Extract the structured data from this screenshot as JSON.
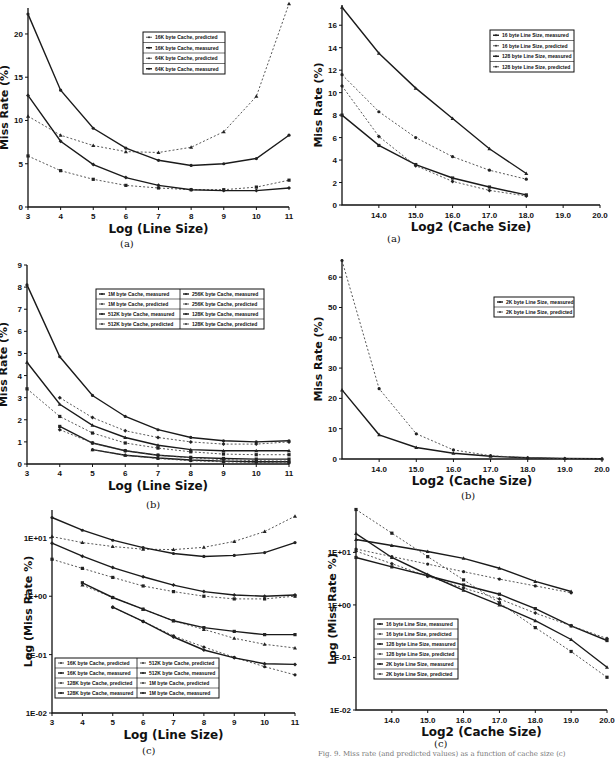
{
  "figure": {
    "footnote_fragment": "Fig. 9.  Miss rate (and predicted values) as a function of cache size (c)",
    "panels": {
      "left_a": {
        "label": "(a)"
      },
      "right_a": {
        "label": "(a)"
      },
      "left_b": {
        "label": "(b)"
      },
      "right_b": {
        "label": "(b)"
      },
      "left_c": {
        "label": "(c)"
      },
      "right_c": {
        "label": "(c)"
      }
    }
  },
  "chart_data": [
    {
      "id": "left_a",
      "type": "line",
      "title": "",
      "xlabel": "Log  (Line Size)",
      "ylabel": "Miss Rate (%)",
      "x": [
        3,
        4,
        5,
        6,
        7,
        8,
        9,
        10,
        11
      ],
      "xticks": [
        "3",
        "4",
        "5",
        "6",
        "7",
        "8",
        "9",
        "10",
        "11"
      ],
      "yticks": [
        "0",
        "5",
        "10",
        "15",
        "20"
      ],
      "ylim": [
        0,
        23
      ],
      "grid": false,
      "legend_position": "upper center",
      "series": [
        {
          "name": "16K byte Cache, predicted",
          "style": "dashed",
          "values": [
            10.5,
            8.3,
            7.1,
            6.4,
            6.3,
            6.9,
            8.7,
            12.8,
            23.5
          ]
        },
        {
          "name": "16K byte Cache, measured",
          "style": "solid",
          "values": [
            22.3,
            13.5,
            9.1,
            6.8,
            5.4,
            4.8,
            5.0,
            5.6,
            8.3
          ]
        },
        {
          "name": "64K byte Cache, predicted",
          "style": "dashed",
          "values": [
            5.9,
            4.2,
            3.2,
            2.5,
            2.2,
            2.0,
            2.0,
            2.3,
            3.1
          ]
        },
        {
          "name": "64K byte Cache, measured",
          "style": "solid",
          "values": [
            12.9,
            7.6,
            4.9,
            3.4,
            2.5,
            2.0,
            1.9,
            1.9,
            2.2
          ]
        }
      ]
    },
    {
      "id": "right_a",
      "type": "line",
      "title": "",
      "xlabel": "Log2 (Cache Size)",
      "ylabel": "Miss Rate (%)",
      "x": [
        13,
        14,
        15,
        16,
        17,
        18
      ],
      "xticks": [
        "14.0",
        "15.0",
        "16.0",
        "17.0",
        "18.0",
        "19.0",
        "20.0"
      ],
      "yticks": [
        "0",
        "2",
        "4",
        "6",
        "8",
        "10",
        "12",
        "14",
        "16"
      ],
      "ylim": [
        0,
        17.5
      ],
      "xlim": [
        13,
        20
      ],
      "grid": false,
      "legend_position": "upper right",
      "series": [
        {
          "name": "16 byte Line Size, measured",
          "style": "solid",
          "values": [
            17.6,
            13.5,
            10.4,
            7.7,
            5.0,
            2.8
          ]
        },
        {
          "name": "16 byte Line Size, predicted",
          "style": "dashed",
          "values": [
            11.6,
            8.3,
            6.0,
            4.3,
            3.1,
            2.3
          ]
        },
        {
          "name": "128 byte Line Size, measured",
          "style": "solid",
          "values": [
            8.0,
            5.3,
            3.6,
            2.4,
            1.6,
            0.9
          ]
        },
        {
          "name": "128 byte Line Size, predicted",
          "style": "dashed",
          "values": [
            10.6,
            6.1,
            3.5,
            2.1,
            1.3,
            0.8
          ]
        }
      ]
    },
    {
      "id": "left_b",
      "type": "line",
      "title": "",
      "xlabel": "Log  (Line Size)",
      "ylabel": "Miss Rate (%)",
      "x": [
        3,
        4,
        5,
        6,
        7,
        8,
        9,
        10,
        11
      ],
      "xticks": [
        "3",
        "4",
        "5",
        "6",
        "7",
        "8",
        "9",
        "10",
        "11"
      ],
      "yticks": [
        "0",
        "1",
        "2",
        "3",
        "4",
        "5",
        "6",
        "7",
        "8",
        "9"
      ],
      "ylim": [
        0,
        9
      ],
      "grid": false,
      "legend_position": "upper right",
      "series": [
        {
          "name": "1M byte Cache, measured",
          "style": "solid",
          "values": [
            null,
            null,
            0.65,
            0.4,
            0.27,
            0.18,
            0.13,
            0.1,
            0.1
          ]
        },
        {
          "name": "1M byte Cache, predicted",
          "style": "dashed",
          "values": [
            null,
            null,
            0.65,
            0.4,
            0.25,
            0.15,
            0.1,
            0.07,
            0.05
          ]
        },
        {
          "name": "512K byte Cache, measured",
          "style": "solid",
          "values": [
            null,
            1.7,
            0.95,
            0.6,
            0.4,
            0.3,
            0.25,
            0.22,
            0.22
          ]
        },
        {
          "name": "512K byte Cache, predicted",
          "style": "dashed",
          "values": [
            null,
            1.55,
            0.95,
            0.6,
            0.4,
            0.28,
            0.2,
            0.15,
            0.13
          ]
        },
        {
          "name": "256K byte Cache, measured",
          "style": "solid",
          "values": [
            4.6,
            2.7,
            1.75,
            1.2,
            0.85,
            0.65,
            0.6,
            0.6,
            0.6
          ]
        },
        {
          "name": "256K byte Cache, predicted",
          "style": "dashed",
          "values": [
            3.4,
            2.15,
            1.4,
            0.95,
            0.72,
            0.55,
            0.45,
            0.42,
            0.42
          ]
        },
        {
          "name": "128K byte Cache, measured",
          "style": "solid",
          "values": [
            8.1,
            4.85,
            3.1,
            2.15,
            1.55,
            1.2,
            1.05,
            1.0,
            1.05
          ]
        },
        {
          "name": "128K byte Cache, predicted",
          "style": "dashed",
          "values": [
            null,
            3.0,
            2.1,
            1.5,
            1.2,
            1.0,
            0.9,
            0.9,
            1.0
          ]
        }
      ]
    },
    {
      "id": "right_b",
      "type": "line",
      "title": "",
      "xlabel": "Log2 (Cache Size)",
      "ylabel": "Miss Rate (%)",
      "x": [
        13,
        14,
        15,
        16,
        17,
        18,
        19,
        20
      ],
      "xticks": [
        "14.0",
        "15.0",
        "16.0",
        "17.0",
        "18.0",
        "19.0",
        "20.0"
      ],
      "yticks": [
        "0",
        "10",
        "20",
        "30",
        "40",
        "50",
        "60"
      ],
      "ylim": [
        0,
        66
      ],
      "xlim": [
        13,
        20
      ],
      "grid": false,
      "legend_position": "upper right",
      "series": [
        {
          "name": "2K byte Line Size, measured",
          "style": "solid",
          "values": [
            22.8,
            8.0,
            3.8,
            1.9,
            0.9,
            0.4,
            0.2,
            0.1
          ]
        },
        {
          "name": "2K byte Line Size, predicted",
          "style": "dashed",
          "values": [
            65.5,
            23.2,
            8.3,
            3.0,
            1.1,
            0.4,
            0.15,
            0.05
          ]
        }
      ]
    },
    {
      "id": "left_c",
      "type": "line",
      "title": "",
      "xlabel": "Log  (Line Size)",
      "ylabel": "Log  (Miss Rate %)",
      "yscale": "log",
      "x": [
        3,
        4,
        5,
        6,
        7,
        8,
        9,
        10,
        11
      ],
      "xticks": [
        "3",
        "4",
        "5",
        "6",
        "7",
        "8",
        "9",
        "10",
        "11"
      ],
      "yticks": [
        "1E-02",
        "1E-01",
        "1E+00",
        "1E+01"
      ],
      "ylim": [
        0.01,
        30
      ],
      "grid": false,
      "legend_position": "lower left",
      "series": [
        {
          "name": "16K byte Cache, predicted",
          "style": "dashed",
          "values": [
            10.5,
            8.3,
            7.1,
            6.4,
            6.3,
            6.9,
            8.7,
            12.8,
            23.5
          ]
        },
        {
          "name": "16K byte Cache, measured",
          "style": "solid",
          "values": [
            22.3,
            13.5,
            9.1,
            6.8,
            5.4,
            4.8,
            5.0,
            5.6,
            8.3
          ]
        },
        {
          "name": "128K byte Cache, predicted",
          "style": "dashed",
          "values": [
            4.3,
            3.0,
            2.1,
            1.5,
            1.2,
            1.0,
            0.9,
            0.9,
            1.0
          ]
        },
        {
          "name": "128K byte Cache, measured",
          "style": "solid",
          "values": [
            8.1,
            4.85,
            3.1,
            2.15,
            1.55,
            1.2,
            1.05,
            1.0,
            1.05
          ]
        },
        {
          "name": "512K byte Cache, predicted",
          "style": "dashed",
          "values": [
            null,
            1.55,
            0.95,
            0.6,
            0.38,
            0.27,
            0.19,
            0.15,
            0.13
          ]
        },
        {
          "name": "512K byte Cache, measured",
          "style": "solid",
          "values": [
            null,
            1.7,
            0.95,
            0.6,
            0.38,
            0.29,
            0.25,
            0.22,
            0.22
          ]
        },
        {
          "name": "1M byte Cache, predicted",
          "style": "dashed",
          "values": [
            null,
            null,
            0.65,
            0.37,
            0.21,
            0.135,
            0.09,
            0.062,
            0.045
          ]
        },
        {
          "name": "1M byte Cache, measured",
          "style": "solid",
          "values": [
            null,
            null,
            0.65,
            0.37,
            0.2,
            0.12,
            0.088,
            0.07,
            0.068
          ]
        }
      ]
    },
    {
      "id": "right_c",
      "type": "line",
      "title": "",
      "xlabel": "Log2 (Cache Size)",
      "ylabel": "Log  (Miss Rate %)",
      "yscale": "log",
      "x": [
        13,
        14,
        15,
        16,
        17,
        18,
        19,
        20
      ],
      "xticks": [
        "14.0",
        "15.0",
        "16.0",
        "17.0",
        "18.0",
        "19.0",
        "20.0"
      ],
      "yticks": [
        "1E-02",
        "1E-01",
        "1E+00",
        "1E+01"
      ],
      "ylim": [
        0.01,
        70
      ],
      "xlim": [
        13,
        20
      ],
      "grid": false,
      "legend_position": "lower left",
      "series": [
        {
          "name": "16 byte Line Size, measured",
          "style": "solid",
          "values": [
            17.6,
            13.5,
            10.4,
            7.7,
            5.0,
            2.8,
            1.8,
            null
          ]
        },
        {
          "name": "16 byte Line Size, predicted",
          "style": "dashed",
          "values": [
            11.6,
            8.3,
            6.0,
            4.3,
            3.1,
            2.3,
            1.7,
            null
          ]
        },
        {
          "name": "128 byte Line Size, measured",
          "style": "solid",
          "values": [
            8.0,
            5.3,
            3.6,
            2.4,
            1.6,
            0.85,
            0.4,
            0.21
          ]
        },
        {
          "name": "128 byte Line Size, predicted",
          "style": "dashed",
          "values": [
            10.6,
            6.1,
            3.5,
            2.1,
            1.3,
            0.7,
            0.4,
            0.23
          ]
        },
        {
          "name": "2K byte Line Size, measured",
          "style": "solid",
          "values": [
            22.8,
            8.0,
            3.8,
            1.9,
            1.0,
            0.5,
            0.22,
            0.065
          ]
        },
        {
          "name": "2K byte Line Size, predicted",
          "style": "dashed",
          "values": [
            65.5,
            23.2,
            8.3,
            3.0,
            1.1,
            0.37,
            0.13,
            0.042
          ]
        }
      ]
    }
  ]
}
